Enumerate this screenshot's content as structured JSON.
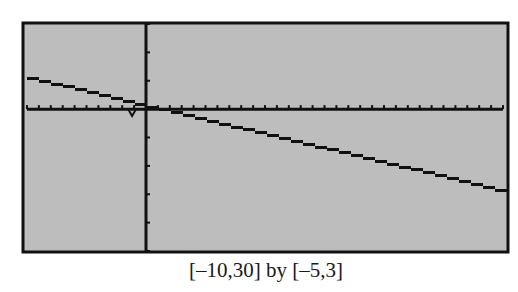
{
  "screen": {
    "background_color": "#bdbdbd",
    "frame_color": "#111111",
    "trace_color": "#111111"
  },
  "caption": {
    "text": "[–10,30] by [–5,3]"
  },
  "chart_data": {
    "type": "line",
    "title": "",
    "xlabel": "",
    "ylabel": "",
    "xlim": [
      -10,
      30
    ],
    "ylim": [
      -5,
      3
    ],
    "xscl": 1,
    "yscl": 1,
    "grid": false,
    "legend": null,
    "window_caption": "[–10,30] by [–5,3]",
    "series": [
      {
        "name": "y1",
        "x": [
          -10,
          -5,
          0,
          5,
          10,
          15,
          20,
          25,
          30
        ],
        "y": [
          1.1,
          0.6,
          0.1,
          -0.4,
          -0.9,
          -1.4,
          -1.9,
          -2.4,
          -2.9
        ]
      }
    ],
    "annotations": [
      {
        "type": "trace-cursor",
        "x": -1,
        "y": -0.1
      }
    ]
  }
}
